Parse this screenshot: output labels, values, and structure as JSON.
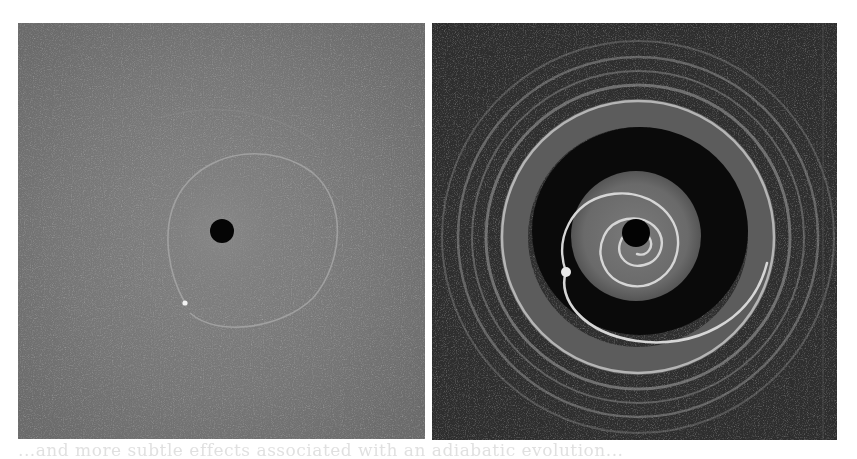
{
  "figure": {
    "panels": [
      {
        "id": "left",
        "description": "Grayscale simulation snapshot: gray disk with small black central hole and faint elliptical spiral ring with bright point (planet)",
        "background_color": "#767676",
        "central_hole": {
          "cx": 204,
          "cy": 208,
          "r": 12,
          "color": "#050505"
        },
        "planet": {
          "cx": 167,
          "cy": 280,
          "r": 2.5,
          "color": "#f2f2f2"
        },
        "ring_color": "#a8a8a8"
      },
      {
        "id": "right",
        "description": "Grayscale simulation snapshot: dark disk with multiple concentric bright rings, dark gap annulus, inner gray disk with tightly wound bright spiral arm and central hole",
        "background_color": "#2e2e2e",
        "central_hole": {
          "cx": 204,
          "cy": 210,
          "r": 14,
          "color": "#030303"
        },
        "planet": {
          "cx": 134,
          "cy": 249,
          "r": 5,
          "color": "#e8e8e8"
        },
        "gap_color": "#0a0a0a",
        "inner_disk_color": "#6c6c6c",
        "ring_color": "#bdbdbd"
      }
    ],
    "bleed_text": "...and more subtle effects associated with an adiabatic evolution..."
  }
}
